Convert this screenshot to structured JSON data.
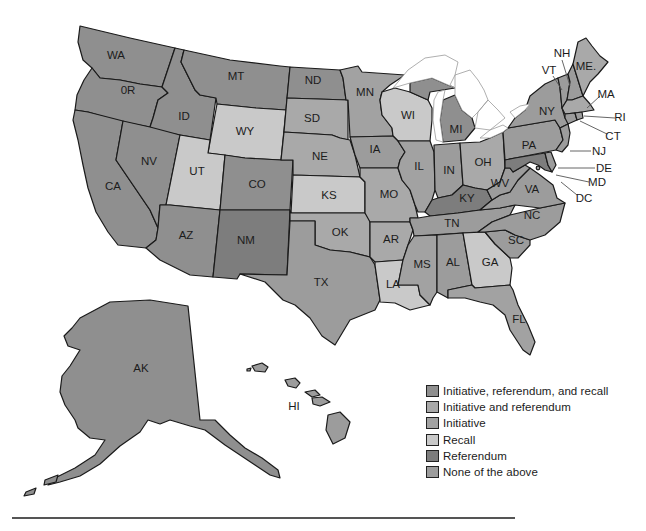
{
  "legend": {
    "items": [
      {
        "key": "irr",
        "label": "Initiative, referendum, and recall",
        "color": "#8f8f8f"
      },
      {
        "key": "ir",
        "label": "Initiative and referendum",
        "color": "#a9a9a9"
      },
      {
        "key": "i",
        "label": "Initiative",
        "color": "#a2a2a2"
      },
      {
        "key": "rc",
        "label": "Recall",
        "color": "#c9c9c9"
      },
      {
        "key": "rf",
        "label": "Referendum",
        "color": "#7d7d7d"
      },
      {
        "key": "none",
        "label": "None of the above",
        "color": "#9c9c9c"
      }
    ]
  },
  "states": {
    "WA": {
      "label": "WA",
      "category": "irr"
    },
    "OR": {
      "label": "0R",
      "category": "irr"
    },
    "CA": {
      "label": "CA",
      "category": "irr"
    },
    "ID": {
      "label": "ID",
      "category": "irr"
    },
    "NV": {
      "label": "NV",
      "category": "irr"
    },
    "MT": {
      "label": "MT",
      "category": "irr"
    },
    "WY": {
      "label": "WY",
      "category": "rc"
    },
    "UT": {
      "label": "UT",
      "category": "rc"
    },
    "CO": {
      "label": "CO",
      "category": "irr"
    },
    "AZ": {
      "label": "AZ",
      "category": "irr"
    },
    "NM": {
      "label": "NM",
      "category": "rf"
    },
    "ND": {
      "label": "ND",
      "category": "irr"
    },
    "SD": {
      "label": "SD",
      "category": "ir"
    },
    "NE": {
      "label": "NE",
      "category": "ir"
    },
    "KS": {
      "label": "KS",
      "category": "rc"
    },
    "OK": {
      "label": "OK",
      "category": "ir"
    },
    "TX": {
      "label": "TX",
      "category": "none"
    },
    "MN": {
      "label": "MN",
      "category": "i"
    },
    "IA": {
      "label": "IA",
      "category": "none"
    },
    "MO": {
      "label": "MO",
      "category": "ir"
    },
    "AR": {
      "label": "AR",
      "category": "ir"
    },
    "LA": {
      "label": "LA",
      "category": "rc"
    },
    "WI": {
      "label": "WI",
      "category": "rc"
    },
    "IL": {
      "label": "IL",
      "category": "i"
    },
    "MI": {
      "label": "MI",
      "category": "irr"
    },
    "IN": {
      "label": "IN",
      "category": "none"
    },
    "OH": {
      "label": "OH",
      "category": "ir"
    },
    "KY": {
      "label": "KY",
      "category": "rf"
    },
    "TN": {
      "label": "TN",
      "category": "none"
    },
    "MS": {
      "label": "MS",
      "category": "i"
    },
    "AL": {
      "label": "AL",
      "category": "none"
    },
    "GA": {
      "label": "GA",
      "category": "rc"
    },
    "FL": {
      "label": "FL",
      "category": "i"
    },
    "SC": {
      "label": "SC",
      "category": "none"
    },
    "NC": {
      "label": "NC",
      "category": "none"
    },
    "VA": {
      "label": "VA",
      "category": "none"
    },
    "WV": {
      "label": "WV",
      "category": "none"
    },
    "PA": {
      "label": "PA",
      "category": "none"
    },
    "NY": {
      "label": "NY",
      "category": "none"
    },
    "VT": {
      "label": "VT",
      "category": "none"
    },
    "NH": {
      "label": "NH",
      "category": "none"
    },
    "ME": {
      "label": "ME.",
      "category": "ir"
    },
    "MA": {
      "label": "MA",
      "category": "ir"
    },
    "RI": {
      "label": "RI",
      "category": "none"
    },
    "CT": {
      "label": "CT",
      "category": "none"
    },
    "NJ": {
      "label": "NJ",
      "category": "none"
    },
    "DE": {
      "label": "DE",
      "category": "none"
    },
    "MD": {
      "label": "MD",
      "category": "rf"
    },
    "DC": {
      "label": "DC",
      "category": "none"
    },
    "AK": {
      "label": "AK",
      "category": "irr"
    },
    "HI": {
      "label": "HI",
      "category": "none"
    }
  }
}
